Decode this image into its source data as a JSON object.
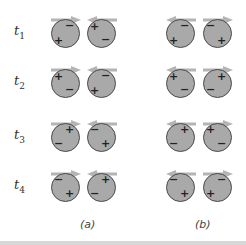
{
  "rows": [
    {
      "label": "t",
      "sub": "1",
      "y": 33
    },
    {
      "label": "t",
      "sub": "2",
      "y": 83
    },
    {
      "label": "t",
      "sub": "3",
      "y": 137
    },
    {
      "label": "t",
      "sub": "4",
      "y": 187
    }
  ],
  "captions": {
    "a": "(a)",
    "b": "(b)"
  },
  "colors": {
    "sphere": "#a9a9a9",
    "arrow": "#b4b4b4",
    "outline": "#4a4a4a"
  },
  "panels": {
    "a": {
      "spheres_x": [
        51,
        87
      ],
      "arrows": [
        [
          "right",
          "left"
        ],
        [
          "right",
          "left"
        ],
        [
          "right",
          "left"
        ],
        [
          "right",
          "left"
        ]
      ],
      "charges": [
        [
          {
            "plus": [
              6,
              20
            ],
            "minus": [
              17,
              5
            ]
          },
          {
            "plus": [
              6,
              6
            ],
            "minus": [
              17,
              19
            ]
          }
        ],
        [
          {
            "plus": [
              6,
              6
            ],
            "minus": [
              17,
              19
            ]
          },
          {
            "plus": [
              6,
              20
            ],
            "minus": [
              17,
              5
            ]
          }
        ],
        [
          {
            "plus": [
              17,
              5
            ],
            "minus": [
              6,
              19
            ]
          },
          {
            "plus": [
              17,
              19
            ],
            "minus": [
              6,
              5
            ]
          }
        ],
        [
          {
            "plus": [
              17,
              19
            ],
            "minus": [
              6,
              5
            ]
          },
          {
            "plus": [
              17,
              5
            ],
            "minus": [
              6,
              19
            ]
          }
        ]
      ]
    },
    "b": {
      "spheres_x": [
        166,
        203
      ],
      "arrows": [
        [
          "left",
          "right"
        ],
        [
          "left",
          "right"
        ],
        [
          "left",
          "right"
        ],
        [
          "left",
          "right"
        ]
      ],
      "charges": [
        [
          {
            "plus": [
              6,
              20
            ],
            "minus": [
              17,
              5
            ]
          },
          {
            "plus": [
              17,
              20
            ],
            "minus": [
              6,
              5
            ]
          }
        ],
        [
          {
            "plus": [
              6,
              6
            ],
            "minus": [
              17,
              19
            ]
          },
          {
            "plus": [
              17,
              6
            ],
            "minus": [
              6,
              19
            ]
          }
        ],
        [
          {
            "plus": [
              17,
              5
            ],
            "minus": [
              6,
              19
            ]
          },
          {
            "plus": [
              6,
              5
            ],
            "minus": [
              17,
              19
            ]
          }
        ],
        [
          {
            "plus": [
              17,
              19
            ],
            "minus": [
              6,
              5
            ]
          },
          {
            "plus": [
              6,
              19
            ],
            "minus": [
              17,
              5
            ]
          }
        ]
      ]
    }
  }
}
